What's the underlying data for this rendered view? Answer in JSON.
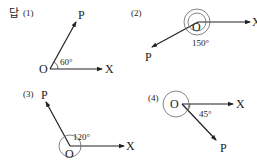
{
  "answer_label": "답",
  "panels": [
    {
      "index": "(1)",
      "vertex": "O",
      "initial_side": "X",
      "terminal_side": "P",
      "angle_label": "60°",
      "angle_deg": 60,
      "rotations": 0,
      "direction": "counterclockwise"
    },
    {
      "index": "(2)",
      "vertex": "O",
      "initial_side": "X",
      "terminal_side": "P",
      "angle_label": "150°",
      "angle_deg": 150,
      "rotations": 1,
      "direction": "clockwise"
    },
    {
      "index": "(3)",
      "vertex": "O",
      "initial_side": "X",
      "terminal_side": "P",
      "angle_label": "120°",
      "angle_deg": 120,
      "rotations": 1,
      "direction": "counterclockwise"
    },
    {
      "index": "(4)",
      "vertex": "O",
      "initial_side": "X",
      "terminal_side": "P",
      "angle_label": "45°",
      "angle_deg": 45,
      "rotations": 1,
      "direction": "clockwise"
    }
  ]
}
